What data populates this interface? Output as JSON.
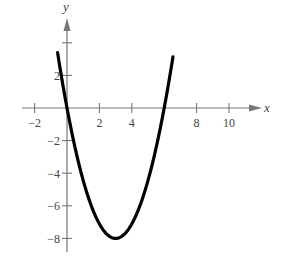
{
  "chart_data": {
    "type": "line",
    "title": "",
    "xlabel": "x",
    "ylabel": "y",
    "xlim": [
      -2.5,
      11.5
    ],
    "ylim": [
      -8.5,
      5.5
    ],
    "grid": false,
    "legend": null,
    "x_ticks": [
      -2,
      2,
      4,
      8,
      10
    ],
    "x_tick_labels": [
      "−2",
      "2",
      "4",
      "8",
      "10"
    ],
    "y_ticks": [
      2,
      -2,
      -4,
      -6,
      -8
    ],
    "y_tick_labels": [
      "2",
      "−2",
      "−4",
      "−6",
      "−8"
    ],
    "extra_unlabeled_ticks": {
      "x": [
        6
      ],
      "y": [
        4
      ]
    },
    "series": [
      {
        "name": "parabola",
        "equation": "y = (8/9)(x - 3)^2 - 8",
        "x": [
          -0.5,
          0,
          1,
          2,
          3,
          4,
          5,
          6,
          6.5
        ],
        "y": [
          2.89,
          0,
          -4.44,
          -7.11,
          -8,
          -7.11,
          -4.44,
          0,
          2.89
        ],
        "color": "#000000"
      }
    ],
    "annotations": {
      "roots": [
        0,
        6
      ],
      "vertex": [
        3,
        -8
      ]
    }
  },
  "colors": {
    "axis": "#777777",
    "curve": "#000000",
    "text": "#444444"
  }
}
